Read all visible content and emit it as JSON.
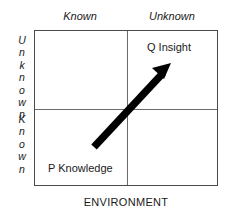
{
  "figure": {
    "type": "2x2-matrix-diagram",
    "columns": {
      "left_label": "Known",
      "right_label": "Unknown"
    },
    "rows": {
      "top_label": "Unknown",
      "bottom_label": "Known"
    },
    "quadrants": {
      "top_right": "Q Insight",
      "bottom_left": "P Knowledge"
    },
    "axis": {
      "bottom_label": "ENVIRONMENT"
    },
    "arrow": {
      "name": "diagonal-progress-arrow",
      "direction": "lower-left-to-upper-right",
      "color": "#000000"
    },
    "colors": {
      "background": "#ffffff",
      "frame": "#4a4a4a",
      "divider": "#6b6b6b",
      "text": "#1a1a1a",
      "arrow": "#000000"
    }
  }
}
